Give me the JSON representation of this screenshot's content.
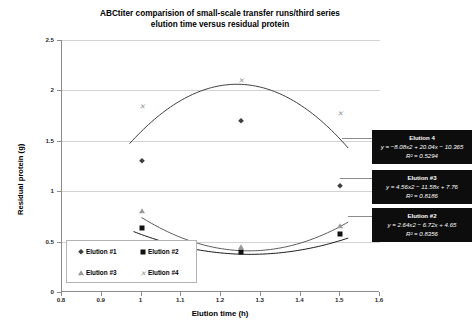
{
  "chart_data": {
    "type": "scatter",
    "title": "ABCtiter comparision of small-scale transfer runs/third series elution time versus residual protein",
    "title_line1": "ABCtiter comparision of small-scale transfer runs/third series",
    "title_line2": "elution time versus residual protein",
    "xlabel": "Elution time (h)",
    "ylabel": "Residual protein (g)",
    "xlim": [
      0.8,
      1.6
    ],
    "ylim": [
      0,
      2.5
    ],
    "xticks": [
      "0.8",
      "0.9",
      "1",
      "1.1",
      "1.2",
      "1.3",
      "1.4",
      "1.5",
      "1.6"
    ],
    "yticks": [
      "0",
      "0.5",
      "1",
      "1.5",
      "2",
      "2.5"
    ],
    "grid": "horizontal",
    "legend_position": "inside-bottom-left",
    "x": [
      1.0,
      1.25,
      1.5
    ],
    "series": [
      {
        "name": "Elution #1",
        "marker": "diamond",
        "values": [
          1.3,
          1.7,
          1.05
        ]
      },
      {
        "name": "Elution #2",
        "marker": "square",
        "values": [
          0.63,
          0.4,
          0.58
        ]
      },
      {
        "name": "Elution #3",
        "marker": "triangle",
        "values": [
          0.8,
          0.45,
          0.65
        ]
      },
      {
        "name": "Elution #4",
        "marker": "cross",
        "values": [
          1.85,
          2.1,
          1.78
        ]
      }
    ],
    "trendlines": [
      {
        "name": "Elution 4",
        "equation": "y = −8.08x2 + 20.04x − 10.365",
        "r2": "R² = 0.5294"
      },
      {
        "name": "Elution #3",
        "equation": "y = 4.56x2 − 11.58x + 7.76",
        "r2": "R² = 0.8186"
      },
      {
        "name": "Elution #2",
        "equation": "y = 2.64x2 − 6.72x + 4.65",
        "r2": "R² = 0.8356"
      }
    ],
    "colors": {
      "series1": "#3f3f3f",
      "series2": "#111111",
      "series3": "#9a9a9a",
      "series4": "#9a9a9a",
      "grid": "#d2d2d2",
      "axis": "#8c8c8c",
      "callout_bg": "#0d0d0d",
      "callout_text": "#ffffff"
    }
  },
  "legend": {
    "items": [
      {
        "label": "Elution #1",
        "marker": "diamond"
      },
      {
        "label": "Elution #2",
        "marker": "square"
      },
      {
        "label": "Elution #3",
        "marker": "triangle"
      },
      {
        "label": "Elution #4",
        "marker": "cross"
      }
    ]
  },
  "callouts": [
    {
      "title": "Elution 4",
      "equation": "y = −8.08x2 + 20.04x − 10.365",
      "r2": "R² = 0.5294"
    },
    {
      "title": "Elution #3",
      "equation": "y = 4.56x2 − 11.58x + 7.76",
      "r2": "R² = 0.8186"
    },
    {
      "title": "Elution #2",
      "equation": "y = 2.64x2 − 6.72x + 4.65",
      "r2": "R² = 0.8356"
    }
  ]
}
